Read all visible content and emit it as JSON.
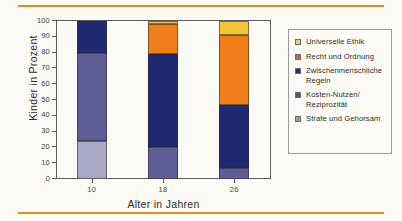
{
  "figure": {
    "background_color": "#fdfbf5",
    "rule_color": "#e98a1f"
  },
  "chart_data": {
    "type": "bar",
    "stacked": true,
    "title": "",
    "xlabel": "Alter  in Jahren",
    "ylabel": "Kinder in Prozent",
    "categories": [
      "10",
      "18",
      "26"
    ],
    "ylim": [
      0,
      100
    ],
    "yticks": [
      0,
      10,
      20,
      30,
      40,
      50,
      60,
      70,
      80,
      90,
      100
    ],
    "grid": false,
    "legend_position": "right",
    "series": [
      {
        "name": "Strafe und Gehorsam",
        "color": "#a9a8c6",
        "values": [
          24,
          0,
          0
        ]
      },
      {
        "name": "Kosten-Nutzen/ Reziprozität",
        "color": "#5f5f96",
        "values": [
          56,
          20,
          7
        ]
      },
      {
        "name": "Zwischenmenschliche Regeln",
        "color": "#1f2a72",
        "values": [
          20,
          59,
          40
        ]
      },
      {
        "name": "Recht und Ordnung",
        "color": "#ef7e1b",
        "values": [
          0,
          19,
          44
        ]
      },
      {
        "name": "Universelle Ethik",
        "color": "#f6c236",
        "values": [
          0,
          2,
          9
        ]
      }
    ]
  },
  "legend": {
    "items": [
      {
        "label": "Universelle Ethik",
        "color": "#f2c98a",
        "series": "Universelle Ethik"
      },
      {
        "label": "Recht und Ordnung",
        "color": "#c06a54",
        "series": "Recht und Ordnung"
      },
      {
        "label": "Zwischenmenschliche Regeln",
        "color": "#2c2c63",
        "series": "Zwischenmenschliche Regeln"
      },
      {
        "label": "Kosten-Nutzen/ Reziprozität",
        "color": "#56568c",
        "series": "Kosten-Nutzen/ Reziprozität"
      },
      {
        "label": "Strafe und Gehorsam",
        "color": "#9a9a9a",
        "series": "Strafe und Gehorsam"
      }
    ]
  }
}
